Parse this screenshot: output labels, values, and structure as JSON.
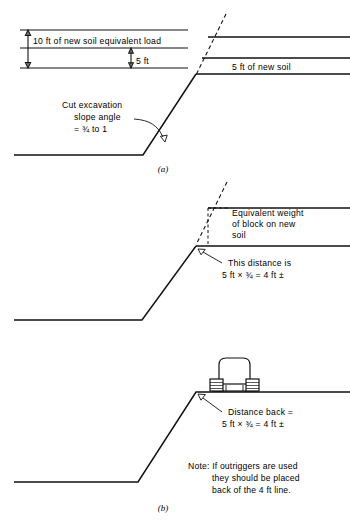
{
  "figure": {
    "title_caption_a": "(a)",
    "title_caption_b": "(b)",
    "colors": {
      "line": "#111111",
      "background": "#ffffff",
      "text": "#000000"
    }
  },
  "panel_a": {
    "dim_load_label": "10 ft of new soil equivalent load",
    "dim_depth_label": "5 ft",
    "soil_layer_label": "5 ft of new soil",
    "slope_note_line1": "Cut excavation",
    "slope_note_line2": "slope angle",
    "slope_note_line3": "= ¾ to 1",
    "caption": "(a)"
  },
  "panel_b_upper": {
    "block_label_line1": "Equivalent weight",
    "block_label_line2": "of block on new",
    "block_label_line3": "soil",
    "distance_label_line1": "This distance is",
    "distance_label_line2": "5 ft ×  ¾ = 4 ft ±"
  },
  "panel_b_lower": {
    "distance_back_line1": "Distance back =",
    "distance_back_line2": "5 ft ×  ¾ = 4 ft ±",
    "note_line1": "Note: If outriggers are used",
    "note_line2": "they should be placed",
    "note_line3": "back of the 4 ft line.",
    "caption": "(b)"
  }
}
